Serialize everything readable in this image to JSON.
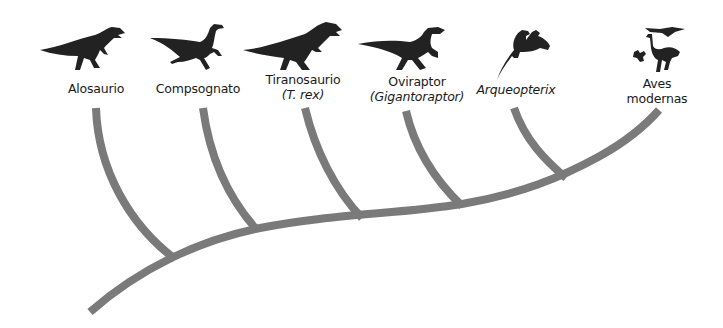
{
  "diagram": {
    "type": "cladogram",
    "branch_color": "#7a7a7a",
    "silhouette_color": "#222222",
    "taxa": [
      {
        "id": "alosaurio",
        "line1": "Alosaurio",
        "line2": "",
        "line2_italic": false
      },
      {
        "id": "compsognato",
        "line1": "Compsognato",
        "line2": "",
        "line2_italic": false
      },
      {
        "id": "tiranosaurio",
        "line1": "Tiranosaurio",
        "line2": "(T. rex)",
        "line2_italic": true
      },
      {
        "id": "oviraptor",
        "line1": "Oviraptor",
        "line2": "(Gigantoraptor)",
        "line2_italic": true
      },
      {
        "id": "arqueopterix",
        "line1": "Arqueopterix",
        "line2": "",
        "line1_italic": true
      },
      {
        "id": "aves-modernas",
        "line1": "Aves",
        "line2": "modernas",
        "line2_italic": false
      }
    ],
    "icons": [
      "allosaurus-silhouette-icon",
      "compsognathus-silhouette-icon",
      "tyrannosaurus-silhouette-icon",
      "oviraptor-silhouette-icon",
      "archaeopteryx-silhouette-icon",
      "modern-birds-silhouette-icon"
    ]
  }
}
